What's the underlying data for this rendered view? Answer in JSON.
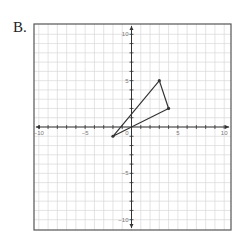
{
  "problem_label": "B.",
  "chart_data": {
    "type": "scatter",
    "title": "",
    "xlabel": "",
    "ylabel": "",
    "xlim": [
      -10.5,
      10.5
    ],
    "ylim": [
      -10.5,
      10.5
    ],
    "grid": true,
    "x_ticks_labeled": [
      -10,
      -5,
      5,
      10
    ],
    "y_ticks_labeled": [
      10,
      5,
      -5,
      -10
    ],
    "origin_label": "0",
    "shapes": [
      {
        "name": "triangle",
        "closed": true,
        "vertices": [
          [
            3,
            5
          ],
          [
            4,
            2
          ],
          [
            -2,
            -1
          ]
        ]
      }
    ]
  },
  "colors": {
    "grid": "#d9d9d9",
    "axis": "#333333",
    "border": "#555555",
    "shape": "#333333"
  }
}
